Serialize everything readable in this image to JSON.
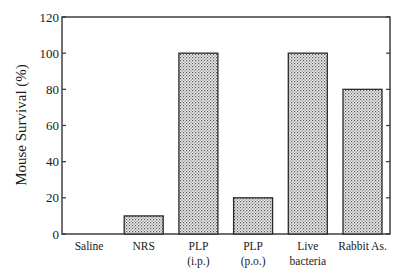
{
  "chart_data": {
    "type": "bar",
    "title": "",
    "xlabel": "",
    "ylabel": "Mouse Survival (%)",
    "ylim": [
      0,
      120
    ],
    "yticks": [
      0,
      20,
      40,
      60,
      80,
      100,
      120
    ],
    "grid": false,
    "legend": null,
    "categories": [
      [
        "Saline"
      ],
      [
        "NRS"
      ],
      [
        "PLP",
        "(i.p.)"
      ],
      [
        "PLP",
        "(p.o.)"
      ],
      [
        "Live",
        "bacteria"
      ],
      [
        "Rabbit As."
      ]
    ],
    "category_names": [
      "Saline",
      "NRS",
      "PLP (i.p.)",
      "PLP (p.o.)",
      "Live bacteria",
      "Rabbit As."
    ],
    "values": [
      0,
      10,
      100,
      20,
      100,
      80
    ],
    "bar_fill": "stippled gray",
    "colors": {
      "bar_edge": "#2a2a2a",
      "bar_fill_dot": "#555555",
      "axis": "#333333"
    }
  }
}
